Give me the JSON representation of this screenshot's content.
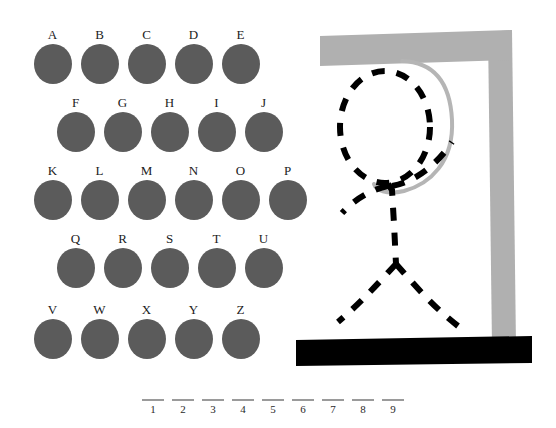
{
  "app": {
    "title": "Hangman",
    "background_color": "#ffffff"
  },
  "colors": {
    "letter_disc": "#5b5b5b",
    "letter_label": "#1c1c1c",
    "gallows": "#b0b0b0",
    "base": "#000000",
    "rope": "#b5b5b5",
    "figure": "#000000",
    "blank_line": "#9a9a9a",
    "blank_number": "#2a2a2a"
  },
  "keyboard": {
    "rows": [
      {
        "row_name": "row-a-e",
        "indent": 29,
        "top": 28,
        "letters": [
          "A",
          "B",
          "C",
          "D",
          "E"
        ]
      },
      {
        "row_name": "row-f-j",
        "indent": 52,
        "top": 96,
        "letters": [
          "F",
          "G",
          "H",
          "I",
          "J"
        ]
      },
      {
        "row_name": "row-k-p",
        "indent": 29,
        "top": 164,
        "letters": [
          "K",
          "L",
          "M",
          "N",
          "O",
          "P"
        ]
      },
      {
        "row_name": "row-q-u",
        "indent": 52,
        "top": 232,
        "letters": [
          "Q",
          "R",
          "S",
          "T",
          "U"
        ]
      },
      {
        "row_name": "row-v-z",
        "indent": 29,
        "top": 303,
        "letters": [
          "V",
          "W",
          "X",
          "Y",
          "Z"
        ]
      }
    ]
  },
  "answer": {
    "blanks": [
      "1",
      "2",
      "3",
      "4",
      "5",
      "6",
      "7",
      "8",
      "9"
    ],
    "letters_revealed": [
      "",
      "",
      "",
      "",
      "",
      "",
      "",
      "",
      ""
    ]
  },
  "gallows": {
    "parts_drawn": [
      "post",
      "crossbeam",
      "base",
      "rope",
      "head",
      "body",
      "left-arm",
      "right-arm",
      "left-leg",
      "right-leg"
    ],
    "figure_style": "dashed",
    "wrong_guesses": 0
  }
}
